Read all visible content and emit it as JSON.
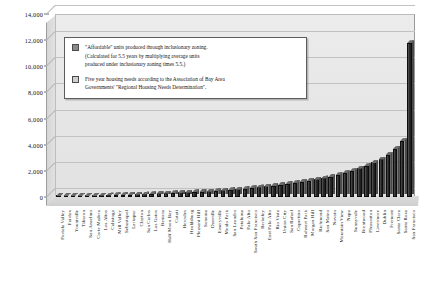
{
  "legend": {
    "entries": [
      {
        "swatch": "dark",
        "lines": [
          "\"Affordable\" units produced through inclusionary zoning.",
          "(Calculated for 5.5 years by multiplying average units",
          "produced under inclusionary zoning times 5.5.)"
        ]
      },
      {
        "swatch": "light",
        "lines": [
          "Five year housing needs according to the Association of Bay Area",
          "Governments' \"Regional Housing Needs Determination\"."
        ]
      }
    ]
  },
  "chart_data": {
    "type": "bar",
    "title": "",
    "xlabel": "",
    "ylabel": "",
    "ylim": [
      0,
      14000
    ],
    "yticks": [
      0,
      2000,
      4000,
      6000,
      8000,
      10000,
      12000,
      14000
    ],
    "ytick_labels": [
      "0",
      "2,000",
      "4,000",
      "6,000",
      "8,000",
      "10,000",
      "12,000",
      "14,000"
    ],
    "grid": true,
    "legend_position": "inside-upper-left",
    "categories": [
      "Portola Valley",
      "Fairfax",
      "Yountville",
      "Tiburon",
      "San Anselmo",
      "Corte Madera",
      "Los Altos",
      "Calistoga",
      "Mill Valley",
      "Sebastopol",
      "Larkspur",
      "Clayton",
      "San Carlos",
      "Los Gatos",
      "Benicia",
      "Half Moon Bay",
      "Cotati",
      "Hercules",
      "Healdsburg",
      "Pleasant Hill",
      "Sonoma",
      "Danville",
      "Emeryville",
      "Menlo Park",
      "San Leandro",
      "Petaluma",
      "Palo Alto",
      "South San Francisco",
      "Berkeley",
      "East Palo Alto",
      "Rio Vista",
      "Union City",
      "San Rafael",
      "Cupertino",
      "Rohnert Park",
      "Morgan Hill",
      "Richmond",
      "San Mateo",
      "Novato",
      "Mountain View",
      "Napa",
      "Sunnyvale",
      "Brentwood",
      "Pleasanton",
      "Livermore",
      "Dublin",
      "Fremont",
      "Santa Clara",
      "Santa Rosa",
      "San Francisco"
    ],
    "series": [
      {
        "name": "Five year housing needs (RHND)",
        "values": [
          60,
          70,
          75,
          90,
          110,
          120,
          140,
          150,
          165,
          180,
          190,
          210,
          230,
          250,
          280,
          300,
          320,
          350,
          370,
          400,
          420,
          450,
          480,
          520,
          560,
          600,
          640,
          700,
          760,
          820,
          880,
          950,
          1020,
          1100,
          1180,
          1260,
          1360,
          1450,
          1560,
          1700,
          1850,
          2000,
          2200,
          2400,
          2650,
          2900,
          3250,
          3700,
          4300,
          11800
        ]
      }
    ]
  }
}
